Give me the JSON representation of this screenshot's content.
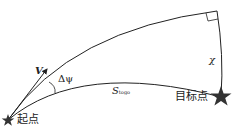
{
  "diagram": {
    "title": "",
    "labels": {
      "start": "起点",
      "target": "目标点",
      "velocity": "V",
      "heading_error": "Δψ",
      "distance_symbol": "S",
      "distance_subscript": "togo",
      "chi": "χ"
    },
    "nodes": [
      {
        "id": "start",
        "label": "起点",
        "shape": "star",
        "x": 8,
        "y": 120
      },
      {
        "id": "target",
        "label": "目标点",
        "shape": "star",
        "x": 221,
        "y": 97
      }
    ],
    "edges": [
      {
        "from": "start",
        "to": "target",
        "type": "curve",
        "label": "S_togo"
      },
      {
        "from": "start",
        "to": "corner",
        "type": "curve",
        "label": ""
      },
      {
        "from": "corner",
        "to": "target",
        "type": "curve",
        "label": "χ"
      }
    ],
    "colors": {
      "line": "#222222",
      "star": "#333333",
      "text": "#222222"
    }
  }
}
